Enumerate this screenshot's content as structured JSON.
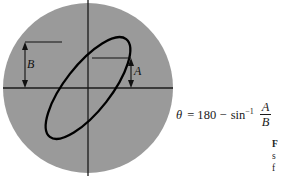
{
  "figure": {
    "background_color": "#ffffff",
    "disk_color": "#9a9a9a",
    "curve_color": "#000000",
    "axis_color": "#1a1a1a",
    "disk": {
      "center_x": 88,
      "center_y": 88,
      "radius": 85
    },
    "axes": {
      "vertical_x": 88,
      "horizontal_y": 88,
      "vertical_label": "",
      "horizontal_label": ""
    },
    "ellipse": {
      "center_x": 88,
      "center_y": 88,
      "semi_major": 62,
      "semi_minor": 23,
      "rotation_deg": -52,
      "stroke_width": 2.2
    }
  },
  "dimensions": [
    {
      "name": "B",
      "label": "B",
      "description": "half-height of ellipse bounding box (y-intercept max)",
      "x": 25,
      "y_top": 42,
      "y_bottom": 88,
      "leader_x_end": 62
    },
    {
      "name": "A",
      "label": "A",
      "description": "y-intercept of ellipse on vertical axis",
      "x": 131,
      "y_top": 58,
      "y_bottom": 88,
      "leader_x_end": 92
    }
  ],
  "equation": {
    "theta": "θ",
    "equals": "=",
    "degrees": "180",
    "minus": "−",
    "function": "sin",
    "exponent": "−1",
    "numerator": "A",
    "denominator": "B",
    "plain_text": "θ = 180 − sin⁻¹ A/B"
  },
  "caption": {
    "line_1": "F",
    "line_2": "s",
    "line_3": "f",
    "note": "figure caption clipped at right edge"
  }
}
